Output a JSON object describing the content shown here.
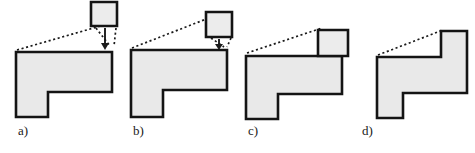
{
  "figure": {
    "background_color": "#ffffff",
    "line_color": "#141414",
    "fill_color": "#e9e9e9",
    "leader_color": "#1a1a1a",
    "width": 475,
    "height": 153
  },
  "panels": [
    {
      "id": "a",
      "label": "a)",
      "label_x": 18,
      "label_y": 130,
      "description": "Square block held far above the polygon, dotted leader lines and arrow point down to the top-right corner",
      "polygon_points": "16,52 112,52 112,92 48,92 48,117 16,117",
      "block_points": "91,2 117,2 117,26 91,26",
      "leaders": [
        "M17,50 L104,25",
        "M96,28 L110,46",
        "M116,28 L114,46"
      ],
      "arrow": {
        "shaft": "M105,28 L105,44",
        "head": "101,43 109,43 105,50"
      }
    },
    {
      "id": "b",
      "label": "b)",
      "label_x": 133,
      "label_y": 130,
      "description": "Square block lowered closer, leader line from polygon top-left and short converging dashes",
      "polygon_points": "131,50 227,50 227,90 163,90 163,117 131,117",
      "block_points": "206,12 232,12 232,37 206,37",
      "leaders": [
        "M132,48 L214,16",
        "M211,38 L224,47",
        "M231,38 L227,47"
      ],
      "arrow": {
        "shaft": "M219,39 L219,45",
        "head": "215,44 223,44 219,50"
      }
    },
    {
      "id": "c",
      "label": "c)",
      "label_x": 248,
      "label_y": 130,
      "description": "Square block resting on the top-right corner of the polygon, single leader line remains",
      "polygon_points": "246,56 342,56 342,94 278,94 278,119 246,119",
      "block_points": "318,30 348,30 348,56 318,56",
      "leaders": [
        "M247,53 L322,28"
      ],
      "arrow": null
    },
    {
      "id": "d",
      "label": "d)",
      "label_x": 362,
      "label_y": 130,
      "description": "Square block merged into the polygon forming a stepped outline, one leader line to the new top corner",
      "polygon_points": "377,57 441,57 441,31 467,31 467,57 467,93 403,93 403,118 377,118",
      "block_points": null,
      "leaders": [
        "M378,55 L443,30"
      ],
      "arrow": null
    }
  ]
}
